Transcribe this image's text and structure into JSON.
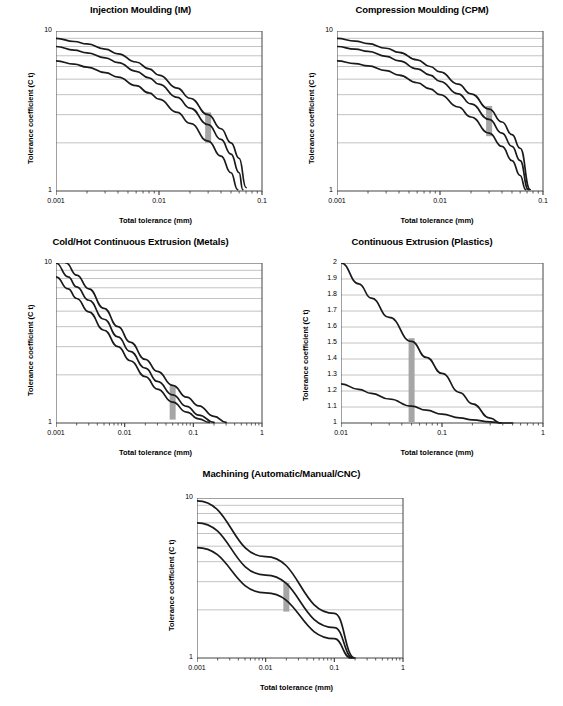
{
  "figure": {
    "axis_titles": {
      "x": "Total tolerance (mm)",
      "y": "Tolerance coefficient (C t)"
    }
  },
  "chart_data": [
    {
      "id": "injection-moulding",
      "type": "line",
      "title": "Injection Moulding (IM)",
      "xlabel": "Total tolerance (mm)",
      "ylabel": "Tolerance coefficient (C t)",
      "xscale": "log",
      "yscale": "log",
      "xlim": [
        0.001,
        0.1
      ],
      "ylim": [
        1,
        10
      ],
      "xticks": [
        "0.001",
        "0.01",
        "0.1"
      ],
      "yticks": [
        "10",
        "1"
      ],
      "grid": "horizontal-log-minor",
      "marker_band": {
        "x": 0.03,
        "y_low": 2.0,
        "y_high": 3.1,
        "color": "#a6a6a6"
      },
      "series": [
        {
          "name": "upper",
          "x": [
            0.001,
            0.0015,
            0.002,
            0.003,
            0.004,
            0.006,
            0.008,
            0.01,
            0.015,
            0.02,
            0.03,
            0.04,
            0.05,
            0.06,
            0.07
          ],
          "y": [
            9.0,
            8.6,
            8.3,
            7.7,
            7.2,
            6.4,
            5.8,
            5.3,
            4.4,
            3.8,
            3.0,
            2.45,
            2.0,
            1.6,
            1.05
          ]
        },
        {
          "name": "middle",
          "x": [
            0.001,
            0.0015,
            0.002,
            0.003,
            0.004,
            0.006,
            0.008,
            0.01,
            0.015,
            0.02,
            0.03,
            0.04,
            0.05,
            0.06,
            0.065
          ],
          "y": [
            8.0,
            7.6,
            7.3,
            6.8,
            6.35,
            5.6,
            5.1,
            4.65,
            3.85,
            3.3,
            2.6,
            2.1,
            1.7,
            1.3,
            1.02
          ]
        },
        {
          "name": "lower",
          "x": [
            0.001,
            0.0015,
            0.002,
            0.003,
            0.004,
            0.006,
            0.008,
            0.01,
            0.015,
            0.02,
            0.03,
            0.04,
            0.05,
            0.058
          ],
          "y": [
            6.5,
            6.2,
            5.95,
            5.5,
            5.15,
            4.55,
            4.1,
            3.75,
            3.1,
            2.65,
            2.05,
            1.65,
            1.3,
            1.02
          ]
        }
      ]
    },
    {
      "id": "compression-moulding",
      "type": "line",
      "title": "Compression Moulding (CPM)",
      "xlabel": "Total tolerance (mm)",
      "ylabel": "Tolerance coefficient (C t)",
      "xscale": "log",
      "yscale": "log",
      "xlim": [
        0.001,
        0.1
      ],
      "ylim": [
        1,
        10
      ],
      "xticks": [
        "0.001",
        "0.01",
        "0.1"
      ],
      "yticks": [
        "10",
        "1"
      ],
      "grid": "horizontal-log-minor",
      "marker_band": {
        "x": 0.03,
        "y_low": 2.2,
        "y_high": 3.4,
        "color": "#a6a6a6"
      },
      "series": [
        {
          "name": "upper",
          "x": [
            0.001,
            0.0015,
            0.002,
            0.003,
            0.004,
            0.006,
            0.008,
            0.01,
            0.015,
            0.02,
            0.03,
            0.04,
            0.05,
            0.06,
            0.075
          ],
          "y": [
            9.0,
            8.65,
            8.35,
            7.8,
            7.35,
            6.6,
            6.0,
            5.55,
            4.65,
            4.05,
            3.25,
            2.7,
            2.25,
            1.85,
            1.02
          ]
        },
        {
          "name": "middle",
          "x": [
            0.001,
            0.0015,
            0.002,
            0.003,
            0.004,
            0.006,
            0.008,
            0.01,
            0.015,
            0.02,
            0.03,
            0.04,
            0.05,
            0.06,
            0.072
          ],
          "y": [
            8.0,
            7.7,
            7.45,
            6.95,
            6.5,
            5.8,
            5.3,
            4.85,
            4.05,
            3.5,
            2.8,
            2.3,
            1.9,
            1.55,
            1.02
          ]
        },
        {
          "name": "lower",
          "x": [
            0.001,
            0.0015,
            0.002,
            0.003,
            0.004,
            0.006,
            0.008,
            0.01,
            0.015,
            0.02,
            0.03,
            0.04,
            0.05,
            0.06,
            0.068
          ],
          "y": [
            6.5,
            6.25,
            6.05,
            5.65,
            5.3,
            4.75,
            4.35,
            4.0,
            3.35,
            2.9,
            2.3,
            1.9,
            1.55,
            1.25,
            1.02
          ]
        }
      ]
    },
    {
      "id": "cold-hot-continuous-extrusion-metals",
      "type": "line",
      "title": "Cold/Hot Continuous Extrusion (Metals)",
      "xlabel": "Total tolerance (mm)",
      "ylabel": "Tolerance coefficient (C t)",
      "xscale": "log",
      "yscale": "log",
      "xlim": [
        0.001,
        1
      ],
      "ylim": [
        1,
        10
      ],
      "xticks": [
        "0.001",
        "0.01",
        "0.1",
        "1"
      ],
      "yticks": [
        "10",
        "1"
      ],
      "grid": "horizontal-log-minor",
      "marker_band": {
        "x": 0.05,
        "y_low": 1.05,
        "y_high": 1.72,
        "color": "#a6a6a6"
      },
      "series": [
        {
          "name": "upper",
          "x": [
            0.0014,
            0.002,
            0.003,
            0.005,
            0.008,
            0.012,
            0.02,
            0.03,
            0.05,
            0.08,
            0.12,
            0.2,
            0.3
          ],
          "y": [
            10.0,
            8.4,
            6.9,
            5.2,
            4.0,
            3.2,
            2.5,
            2.1,
            1.72,
            1.45,
            1.28,
            1.1,
            1.01
          ]
        },
        {
          "name": "middle",
          "x": [
            0.001,
            0.0015,
            0.002,
            0.003,
            0.005,
            0.008,
            0.012,
            0.02,
            0.03,
            0.05,
            0.08,
            0.12,
            0.2
          ],
          "y": [
            10.0,
            8.2,
            7.1,
            5.85,
            4.45,
            3.45,
            2.8,
            2.2,
            1.82,
            1.5,
            1.27,
            1.12,
            1.01
          ]
        },
        {
          "name": "lower",
          "x": [
            0.001,
            0.0015,
            0.002,
            0.003,
            0.005,
            0.008,
            0.012,
            0.02,
            0.03,
            0.05,
            0.08,
            0.12,
            0.17
          ],
          "y": [
            8.2,
            6.9,
            6.0,
            4.95,
            3.8,
            3.0,
            2.45,
            1.95,
            1.63,
            1.35,
            1.17,
            1.06,
            1.01
          ]
        }
      ]
    },
    {
      "id": "continuous-extrusion-plastics",
      "type": "line",
      "title": "Continuous Extrusion (Plastics)",
      "xlabel": "Total tolerance (mm)",
      "ylabel": "Tolerance coefficient (C t)",
      "xscale": "log",
      "yscale": "linear",
      "xlim": [
        0.01,
        1
      ],
      "ylim": [
        1,
        2
      ],
      "xticks": [
        "0.01",
        "0.1",
        "1"
      ],
      "yticks": [
        "2",
        "1.9",
        "1.8",
        "1.7",
        "1.6",
        "1.5",
        "1.4",
        "1.3",
        "1.2",
        "1.1",
        "1"
      ],
      "grid": "horizontal-linear",
      "marker_band": {
        "x": 0.05,
        "y_low": 1.0,
        "y_high": 1.53,
        "color": "#a6a6a6"
      },
      "series": [
        {
          "name": "upper",
          "x": [
            0.01,
            0.015,
            0.02,
            0.03,
            0.05,
            0.07,
            0.1,
            0.15,
            0.2,
            0.3,
            0.38
          ],
          "y": [
            2.0,
            1.87,
            1.78,
            1.66,
            1.51,
            1.41,
            1.31,
            1.19,
            1.12,
            1.03,
            1.0
          ]
        },
        {
          "name": "lower",
          "x": [
            0.01,
            0.015,
            0.02,
            0.03,
            0.05,
            0.07,
            0.1,
            0.15,
            0.2,
            0.3,
            0.4,
            0.5
          ],
          "y": [
            1.245,
            1.21,
            1.185,
            1.15,
            1.105,
            1.08,
            1.055,
            1.032,
            1.02,
            1.007,
            1.0,
            1.0
          ]
        }
      ]
    },
    {
      "id": "machining-automatic-manual-cnc",
      "type": "line",
      "title": "Machining (Automatic/Manual/CNC)",
      "xlabel": "Total tolerance (mm)",
      "ylabel": "Tolerance coefficient (C t)",
      "xscale": "log",
      "yscale": "log",
      "xlim": [
        0.001,
        1
      ],
      "ylim": [
        1,
        10
      ],
      "xticks": [
        "0.001",
        "0.01",
        "0.1",
        "1"
      ],
      "yticks": [
        "10",
        "1"
      ],
      "grid": "horizontal-log-minor",
      "marker_band": {
        "x": 0.02,
        "y_low": 1.95,
        "y_high": 2.95,
        "color": "#a6a6a6"
      },
      "series": [
        {
          "name": "upper",
          "x": [
            0.001,
            0.01,
            0.1,
            0.2
          ],
          "y": [
            9.6,
            4.3,
            1.9,
            1.0
          ]
        },
        {
          "name": "middle",
          "x": [
            0.001,
            0.01,
            0.1,
            0.19
          ],
          "y": [
            7.0,
            3.3,
            1.55,
            1.0
          ]
        },
        {
          "name": "lower",
          "x": [
            0.001,
            0.01,
            0.1,
            0.175
          ],
          "y": [
            4.9,
            2.55,
            1.32,
            1.0
          ]
        }
      ]
    }
  ]
}
